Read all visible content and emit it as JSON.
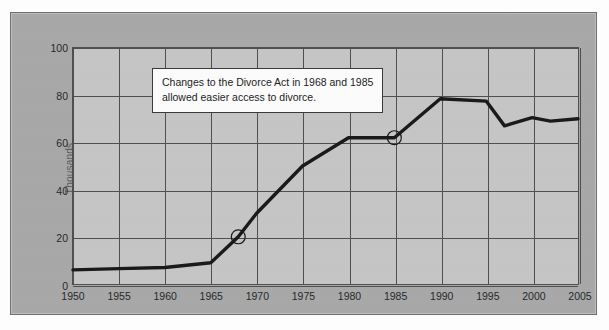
{
  "chart_data": {
    "type": "line",
    "title": "",
    "xlabel": "",
    "ylabel": "Thousands",
    "xlim": [
      1950,
      2005
    ],
    "ylim": [
      0,
      100
    ],
    "grid": true,
    "legend": null,
    "y_ticks": [
      0,
      20,
      40,
      60,
      80,
      100
    ],
    "y_tick_labels": [
      "0",
      "20",
      "40",
      "60",
      "80",
      "100"
    ],
    "x_ticks": [
      1950,
      1955,
      1960,
      1965,
      1970,
      1975,
      1980,
      1985,
      1990,
      1995,
      2000,
      2005
    ],
    "x_tick_labels": [
      "1950",
      "1955",
      "1960",
      "1965",
      "1970",
      "1975",
      "1980",
      "1985",
      "1990",
      "1995",
      "2000",
      "2005"
    ],
    "series": [
      {
        "name": "Divorces",
        "color": "#1a1a1a",
        "x": [
          1950,
          1955,
          1960,
          1965,
          1968,
          1970,
          1975,
          1980,
          1985,
          1990,
          1995,
          1997,
          2000,
          2002,
          2005
        ],
        "values": [
          6,
          6.5,
          7,
          9,
          20,
          30,
          50,
          62,
          62,
          78.5,
          77.5,
          67,
          70.5,
          69,
          70
        ]
      }
    ],
    "markers": [
      {
        "name": "marker-1968",
        "x": 1968,
        "y": 20,
        "shape": "open-circle"
      },
      {
        "name": "marker-1985",
        "x": 1985,
        "y": 62,
        "shape": "open-circle"
      }
    ],
    "annotations": [
      {
        "name": "divorce-act-note",
        "line1": "Changes to the Divorce Act in 1968 and 1985",
        "line2": "allowed easier access to divorce."
      }
    ]
  },
  "colors": {
    "page_background": "#fdfdfd",
    "panel_background": "#a8a8a8",
    "plot_background": "#c5c5c5",
    "grid": "#4f4f4f",
    "series": "#1a1a1a",
    "annotation_background": "#fbfbfb",
    "text": "#26282b",
    "axis_label_text": "#555a5e"
  }
}
